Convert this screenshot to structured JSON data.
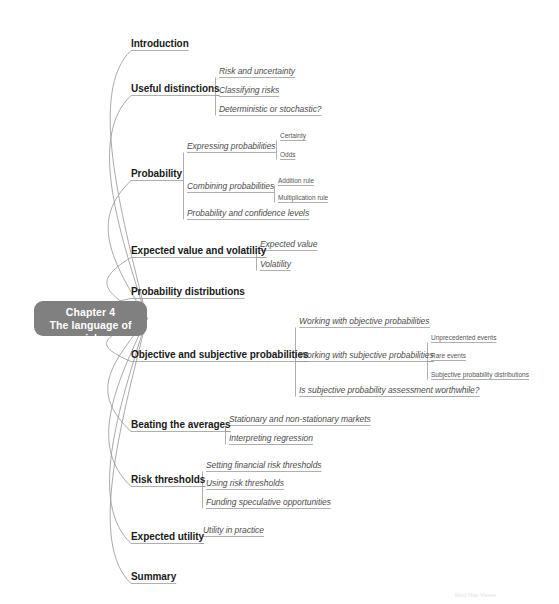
{
  "meta": {
    "background_color": "#ffffff",
    "root_color": "#808080",
    "root_text_color": "#ffffff",
    "level1_text_color": "#1a1a1a",
    "level2_text_color": "#4d4d4d",
    "level3_text_color": "#555555",
    "branch_line_color": "#9a9a9a"
  },
  "root": {
    "line1": "Chapter 4",
    "line2": "The language of risk"
  },
  "watermark": {
    "text": "Mind Map Viewer"
  },
  "branches": [
    {
      "label": "Introduction",
      "children": []
    },
    {
      "label": "Useful distinctions",
      "children": [
        {
          "label": "Risk and uncertainty",
          "children": []
        },
        {
          "label": "Classifying risks",
          "children": []
        },
        {
          "label": "Deterministic or stochastic?",
          "children": []
        }
      ]
    },
    {
      "label": "Probability",
      "children": [
        {
          "label": "Expressing probabilities",
          "children": [
            {
              "label": "Certainty"
            },
            {
              "label": "Odds"
            }
          ]
        },
        {
          "label": "Combining probabilities",
          "children": [
            {
              "label": "Addition rule"
            },
            {
              "label": "Multiplication rule"
            }
          ]
        },
        {
          "label": "Probability and confidence levels",
          "children": []
        }
      ]
    },
    {
      "label": "Expected value and volatility",
      "children": [
        {
          "label": "Expected value",
          "children": []
        },
        {
          "label": "Volatility",
          "children": []
        }
      ]
    },
    {
      "label": "Probability distributions",
      "children": []
    },
    {
      "label": "Objective and subjective probabilities",
      "children": [
        {
          "label": "Working with objective probabilities",
          "children": []
        },
        {
          "label": "Working with subjective probabilities",
          "children": [
            {
              "label": "Unprecedented events"
            },
            {
              "label": "Rare events"
            },
            {
              "label": "Subjective probability distributions"
            }
          ]
        },
        {
          "label": "Is subjective probability assessment worthwhile?",
          "children": []
        }
      ]
    },
    {
      "label": "Beating the averages",
      "children": [
        {
          "label": "Stationary and non-stationary markets",
          "children": []
        },
        {
          "label": "Interpreting regression",
          "children": []
        }
      ]
    },
    {
      "label": "Risk thresholds",
      "children": [
        {
          "label": "Setting financial risk thresholds",
          "children": []
        },
        {
          "label": "Using risk thresholds",
          "children": []
        },
        {
          "label": "Funding speculative opportunities",
          "children": []
        }
      ]
    },
    {
      "label": "Expected utility",
      "children": [
        {
          "label": "Utility in practice",
          "children": []
        }
      ]
    },
    {
      "label": "Summary",
      "children": []
    }
  ]
}
